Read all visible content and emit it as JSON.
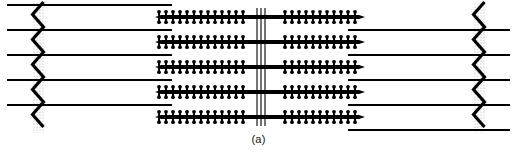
{
  "figure": {
    "caption": "(a)",
    "panel_label": "(a)",
    "canvas": {
      "width": 517,
      "height": 162
    },
    "colors": {
      "ink": "#000000",
      "background": "#ffffff",
      "halftone": "#b8b8b8"
    }
  },
  "structures": {
    "thick_filaments": {
      "name": "myosin-thick-filament",
      "count": 5,
      "y_positions": [
        17,
        42,
        67,
        92,
        117
      ],
      "x_start": 155,
      "x_end": 365,
      "shaft_thickness": 4.2,
      "crossbridge": {
        "name": "myosin-crossbridge",
        "pitch": 7.0,
        "arm_length": 5.2,
        "arm_thickness": 2.0,
        "head_radius": 1.9
      },
      "bare_zone": {
        "x_start": 243,
        "x_end": 279
      },
      "taper_tip_length": 6
    },
    "thin_filaments": {
      "name": "actin-thin-filament",
      "count_left": 5,
      "count_right": 5,
      "thickness": 1.9,
      "left": {
        "y_positions": [
          5,
          30,
          55,
          80,
          105
        ],
        "x_start": 7,
        "x_end": 172,
        "zline_attach_x": 38
      },
      "right": {
        "y_positions": [
          30,
          55,
          80,
          105,
          130
        ],
        "x_start": 348,
        "x_end": 510,
        "zline_attach_x": 479
      }
    },
    "z_lines": {
      "name": "z-line",
      "count": 2,
      "zigzag_amplitude": 10,
      "zigzag_period": 25,
      "stroke_width": 3.2,
      "left": {
        "x_center": 38,
        "y_top": 2,
        "y_bottom": 133
      },
      "right": {
        "x_center": 479,
        "y_top": 2,
        "y_bottom": 133
      }
    },
    "m_line": {
      "name": "m-line",
      "count": 3,
      "x_positions": [
        257,
        261,
        265
      ],
      "y_top": 8,
      "y_bottom": 126,
      "stroke_width": 1.1
    }
  },
  "chart_data": {
    "type": "diagram",
    "subtitle": "(a)",
    "elements": [
      {
        "label": "Thick (myosin) filament",
        "count": 5,
        "orientation": "horizontal",
        "feature": "cross-bridges along shaft, bare central zone"
      },
      {
        "label": "Thin (actin) filament",
        "count": 10,
        "orientation": "horizontal",
        "feature": "anchored to Z-lines, interdigitated between thick filaments"
      },
      {
        "label": "Z-line",
        "count": 2,
        "orientation": "vertical zigzag",
        "feature": "left and right boundaries of the sarcomere"
      },
      {
        "label": "M-line",
        "count": 3,
        "orientation": "vertical",
        "feature": "three thin vertical lines at the centre of the thick filaments"
      }
    ]
  }
}
